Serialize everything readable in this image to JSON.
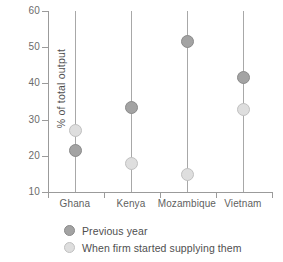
{
  "chart_data": {
    "type": "scatter",
    "title": "",
    "xlabel": "",
    "ylabel": "% of total output",
    "categories": [
      "Ghana",
      "Kenya",
      "Mozambique",
      "Vietnam"
    ],
    "ylim": [
      10,
      60
    ],
    "yticks": [
      10,
      20,
      30,
      40,
      50,
      60
    ],
    "ytick_labels": [
      "10",
      "20",
      "30",
      "40",
      "50",
      "60"
    ],
    "grid": false,
    "legend_position": "bottom",
    "series": [
      {
        "name": "Previous year",
        "color": "#a3a3a3",
        "values": [
          21.4,
          33.3,
          51.7,
          41.6
        ]
      },
      {
        "name": "When firm started supplying them",
        "color": "#dedede",
        "values": [
          27.1,
          17.9,
          14.8,
          32.7
        ]
      }
    ],
    "connectors": [
      {
        "category": "Ghana",
        "low": 10,
        "high": 60
      },
      {
        "category": "Kenya",
        "low": 10,
        "high": 60
      },
      {
        "category": "Mozambique",
        "low": 10,
        "high": 60
      },
      {
        "category": "Vietnam",
        "low": 10,
        "high": 60
      }
    ]
  },
  "legend": {
    "items": [
      {
        "label": "Previous year",
        "marker": "filled-circle-dark"
      },
      {
        "label": "When firm started supplying them",
        "marker": "filled-circle-light"
      }
    ]
  }
}
